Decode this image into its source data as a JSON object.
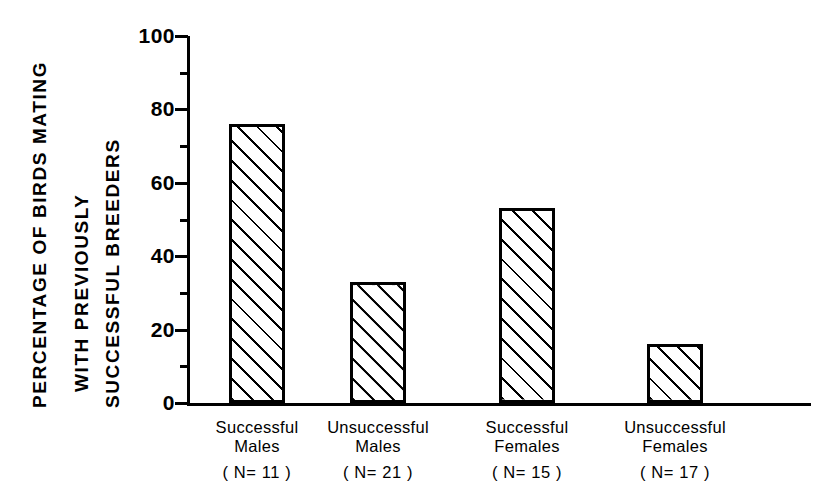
{
  "chart_data": {
    "type": "bar",
    "title": "",
    "subtitle": "",
    "xlabel": "",
    "ylabel_lines": [
      "PERCENTAGE OF BIRDS MATING",
      "WITH PREVIOUSLY",
      "SUCCESSFUL BREEDERS"
    ],
    "ylabel": "PERCENTAGE OF BIRDS MATING WITH PREVIOUSLY SUCCESSFUL BREEDERS",
    "categories": [
      "Successful Males",
      "Unsuccessful Males",
      "Successful Females",
      "Unsuccessful Females"
    ],
    "category_lines": [
      [
        "Successful",
        "Males"
      ],
      [
        "Unsuccessful",
        "Males"
      ],
      [
        "Successful",
        "Females"
      ],
      [
        "Unsuccessful",
        "Females"
      ]
    ],
    "sample_sizes": [
      "( N= 11 )",
      "( N= 21 )",
      "( N= 15 )",
      "( N= 17 )"
    ],
    "n_values": [
      11,
      21,
      15,
      17
    ],
    "values": [
      76,
      33,
      53,
      16
    ],
    "ylim": [
      0,
      100
    ],
    "ytick_major": [
      0,
      20,
      40,
      60,
      80,
      100
    ],
    "ytick_minor": [
      10,
      30,
      50,
      70,
      90
    ],
    "ytick_labels": [
      "0",
      "20",
      "40",
      "60",
      "80",
      "100"
    ],
    "grid": false,
    "legend": "none",
    "bar_fill": "diagonal-hatch",
    "colors": {
      "axis": "#000000",
      "bar_edge": "#000000",
      "bar_hatch": "#000000",
      "background": "#ffffff"
    }
  }
}
